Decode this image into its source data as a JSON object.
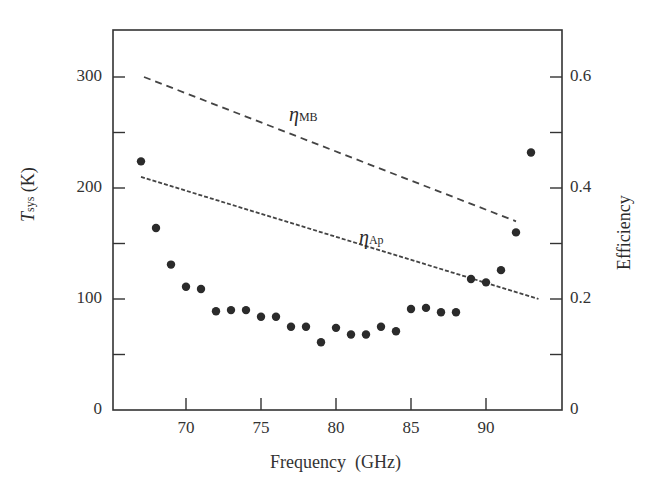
{
  "chart_data": {
    "type": "scatter",
    "title": "",
    "xlabel": "Frequency (GHz)",
    "ylabel": "T_sys (K)",
    "ylabel_right": "Efficiency",
    "xlim": [
      65.2,
      95.2
    ],
    "ylim": [
      0,
      345
    ],
    "ylim_right": [
      0,
      0.69
    ],
    "grid": false,
    "x_ticks": [
      70,
      75,
      80,
      85,
      90
    ],
    "y_ticks": [
      0,
      100,
      200,
      300
    ],
    "y_ticks_right": [
      0,
      0.2,
      0.4,
      0.6
    ],
    "series": [
      {
        "name": "T_sys",
        "type": "scatter",
        "axis": "left",
        "x": [
          67,
          68,
          69,
          70,
          71,
          72,
          73,
          74,
          75,
          76,
          77,
          78,
          79,
          80,
          81,
          82,
          83,
          84,
          85,
          86,
          87,
          88,
          89,
          90,
          91,
          92,
          93
        ],
        "values": [
          224,
          164,
          131,
          111,
          109,
          89,
          90,
          90,
          84,
          84,
          75,
          75,
          61,
          74,
          68,
          68,
          75,
          71,
          91,
          92,
          88,
          88,
          118,
          115,
          126,
          160,
          232
        ]
      },
      {
        "name": "η_MB",
        "type": "line",
        "style": "dashed",
        "axis": "right",
        "x": [
          67.2,
          92
        ],
        "values": [
          0.6,
          0.34
        ]
      },
      {
        "name": "η_Ap",
        "type": "line",
        "style": "dotted-dashed",
        "axis": "right",
        "x": [
          67,
          93.5
        ],
        "values": [
          0.42,
          0.2
        ]
      }
    ],
    "annotations": [
      {
        "text": "η_MB",
        "x": 78,
        "y_right": 0.56
      },
      {
        "text": "η_Ap",
        "x": 81.5,
        "y_right": 0.36
      }
    ]
  },
  "labels": {
    "xlabel": "Frequency  (GHz)",
    "ylabel_left_main": "T",
    "ylabel_left_sub": "sys",
    "ylabel_left_unit": " (K)",
    "ylabel_right": "Efficiency",
    "eta_mb_main": "η",
    "eta_mb_sub": "MB",
    "eta_ap_main": "η",
    "eta_ap_sub": "Ap"
  },
  "ticks": {
    "left": [
      "0",
      "100",
      "200",
      "300"
    ],
    "right": [
      "0",
      "0.2",
      "0.4",
      "0.6"
    ],
    "bottom": [
      "70",
      "75",
      "80",
      "85",
      "90"
    ]
  }
}
